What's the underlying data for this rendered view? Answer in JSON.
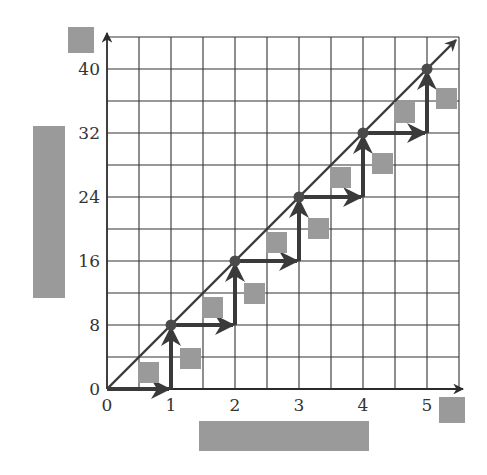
{
  "chart_data": {
    "type": "line",
    "title": "",
    "xlabel": "[redacted]",
    "ylabel": "[redacted]",
    "x": [
      0,
      1,
      2,
      3,
      4,
      5
    ],
    "series": [
      {
        "name": "y = 8x",
        "values": [
          0,
          8,
          16,
          24,
          32,
          40
        ]
      }
    ],
    "steps": [
      {
        "from": [
          0,
          0
        ],
        "run": 1,
        "rise": 8
      },
      {
        "from": [
          1,
          8
        ],
        "run": 1,
        "rise": 8
      },
      {
        "from": [
          2,
          16
        ],
        "run": 1,
        "rise": 8
      },
      {
        "from": [
          3,
          24
        ],
        "run": 1,
        "rise": 8
      },
      {
        "from": [
          4,
          32
        ],
        "run": 1,
        "rise": 8
      }
    ],
    "x_ticks": [
      "0",
      "1",
      "2",
      "3",
      "4",
      "5"
    ],
    "y_ticks": [
      "0",
      "8",
      "16",
      "24",
      "32",
      "40"
    ],
    "xlim": [
      0,
      5.5
    ],
    "ylim": [
      0,
      44
    ],
    "grid": true,
    "grid_step": {
      "x": 0.5,
      "y": 4
    },
    "legend": "none",
    "annotations": "gray redaction boxes labeling each run/rise arrow and axes"
  },
  "colors": {
    "axis": "#2b2b2b",
    "grid": "#333333",
    "arrow": "#3a3a3a",
    "point": "#4a4a4a",
    "redaction": "#9a9a9a"
  }
}
